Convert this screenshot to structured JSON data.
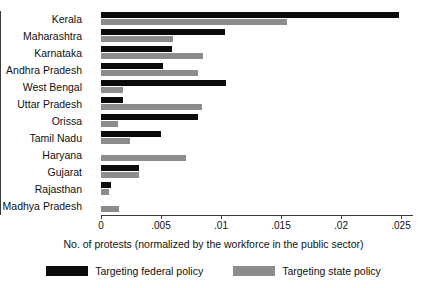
{
  "chart_data": {
    "type": "bar",
    "orientation": "horizontal",
    "title": "",
    "xlabel": "No. of protests (normalized by the workforce in the public sector)",
    "ylabel": "",
    "xlim": [
      0,
      0.026
    ],
    "xticks": [
      0,
      0.005,
      0.01,
      0.015,
      0.02,
      0.025
    ],
    "xtick_labels": [
      "0",
      ".005",
      ".01",
      ".015",
      ".02",
      ".025"
    ],
    "grid": false,
    "legend_position": "bottom",
    "categories": [
      "Kerala",
      "Maharashtra",
      "Karnataka",
      "Andhra Pradesh",
      "West Bengal",
      "Uttar Pradesh",
      "Orissa",
      "Tamil Nadu",
      "Haryana",
      "Gujarat",
      "Rajasthan",
      "Madhya Pradesh"
    ],
    "series": [
      {
        "name": "Targeting federal policy",
        "color": "#0b0b0b",
        "values": [
          0.0248,
          0.0103,
          0.0059,
          0.0052,
          0.0104,
          0.0018,
          0.0081,
          0.005,
          0.0,
          0.0032,
          0.0008,
          0.0
        ]
      },
      {
        "name": "Targeting state policy",
        "color": "#8c8c8c",
        "values": [
          0.0155,
          0.006,
          0.0085,
          0.0081,
          0.0018,
          0.0084,
          0.0014,
          0.0024,
          0.0071,
          0.0032,
          0.0007,
          0.0015
        ]
      }
    ]
  }
}
